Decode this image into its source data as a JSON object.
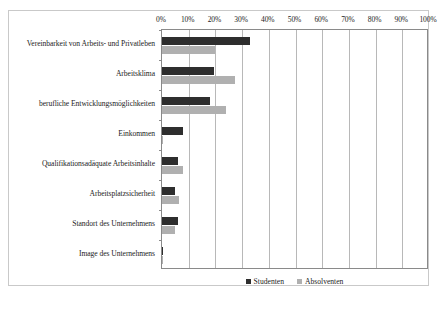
{
  "chart_data": {
    "type": "bar",
    "orientation": "horizontal",
    "title": "",
    "xlabel": "",
    "ylabel": "",
    "xlim": [
      0,
      100
    ],
    "xticks": [
      "0%",
      "10%",
      "20%",
      "30%",
      "40%",
      "50%",
      "60%",
      "70%",
      "80%",
      "90%",
      "100%"
    ],
    "grid": true,
    "legend_position": "bottom",
    "categories": [
      "Vereinbarkeit von Arbeits- und Privatleben",
      "Arbeitsklima",
      "berufliche Entwicklungsmöglichkeiten",
      "Einkommen",
      "Qualifikationsadäquate Arbeitsinhalte",
      "Arbeitsplatzsicherheit",
      "Standort des Unternehmens",
      "Image des Unternehmens"
    ],
    "series": [
      {
        "name": "Studenten",
        "color": "#2e2e2e",
        "values": [
          33,
          19.5,
          18,
          8,
          6,
          5,
          6,
          0.5
        ]
      },
      {
        "name": "Absolventen",
        "color": "#b0b0b0",
        "values": [
          20,
          27.5,
          24,
          0.5,
          8,
          6.5,
          5,
          0.5
        ]
      }
    ]
  },
  "legend": {
    "entries": [
      {
        "label": "Studenten"
      },
      {
        "label": "Absolventen"
      }
    ]
  }
}
